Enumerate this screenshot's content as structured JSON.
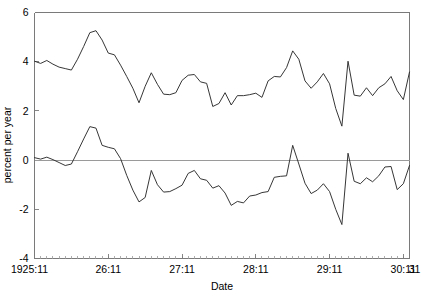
{
  "chart_data": {
    "type": "line",
    "title": "",
    "xlabel": "Date",
    "ylabel": "percent per year",
    "ylim": [
      -4,
      6
    ],
    "yticks": [
      -4,
      -2,
      0,
      2,
      4,
      6
    ],
    "ytick_labels": [
      "-4",
      "-2",
      "0",
      "2",
      "4",
      "6"
    ],
    "xlim": [
      0,
      61
    ],
    "xticks": [
      0,
      12,
      24,
      36,
      48,
      60
    ],
    "xtick_labels": [
      "1925:11",
      "26:11",
      "27:11",
      "28:11",
      "29:11",
      "30:11",
      "31"
    ],
    "xtick_positions": [
      0,
      12,
      24,
      36,
      48,
      60,
      61
    ],
    "grid": false,
    "legend": "none",
    "zero_line": 0,
    "minor_tick_interval": 1,
    "n_points": 62,
    "x": [
      0,
      1,
      2,
      3,
      4,
      5,
      6,
      7,
      8,
      9,
      10,
      11,
      12,
      13,
      14,
      15,
      16,
      17,
      18,
      19,
      20,
      21,
      22,
      23,
      24,
      25,
      26,
      27,
      28,
      29,
      30,
      31,
      32,
      33,
      34,
      35,
      36,
      37,
      38,
      39,
      40,
      41,
      42,
      43,
      44,
      45,
      46,
      47,
      48,
      49,
      50,
      51,
      52,
      53,
      54,
      55,
      56,
      57,
      58,
      59,
      60,
      61
    ],
    "series": [
      {
        "name": "upper",
        "values": [
          4.02,
          3.93,
          4.05,
          3.9,
          3.78,
          3.72,
          3.66,
          4.1,
          4.62,
          5.18,
          5.26,
          4.88,
          4.35,
          4.28,
          3.86,
          3.4,
          2.92,
          2.33,
          3.0,
          3.55,
          3.08,
          2.68,
          2.66,
          2.74,
          3.24,
          3.45,
          3.48,
          3.18,
          3.12,
          2.18,
          2.3,
          2.74,
          2.24,
          2.62,
          2.62,
          2.66,
          2.72,
          2.55,
          3.22,
          3.4,
          3.38,
          3.76,
          4.44,
          4.1,
          3.22,
          2.92,
          3.18,
          3.52,
          3.1,
          2.1,
          1.38,
          4.02,
          2.64,
          2.6,
          2.94,
          2.62,
          2.94,
          3.1,
          3.4,
          2.82,
          2.46,
          3.58
        ]
      },
      {
        "name": "lower",
        "values": [
          0.1,
          0.04,
          0.12,
          0.02,
          -0.1,
          -0.22,
          -0.16,
          0.34,
          0.86,
          1.36,
          1.3,
          0.6,
          0.52,
          0.46,
          0.06,
          -0.62,
          -1.22,
          -1.7,
          -1.52,
          -0.42,
          -1.0,
          -1.3,
          -1.28,
          -1.16,
          -1.02,
          -0.54,
          -0.42,
          -0.76,
          -0.82,
          -1.14,
          -1.04,
          -1.34,
          -1.84,
          -1.68,
          -1.74,
          -1.46,
          -1.42,
          -1.32,
          -1.28,
          -0.7,
          -0.66,
          -0.64,
          0.6,
          -0.16,
          -0.94,
          -1.36,
          -1.22,
          -0.96,
          -1.28,
          -2.0,
          -2.62,
          0.28,
          -0.86,
          -0.96,
          -0.72,
          -0.88,
          -0.64,
          -0.28,
          -0.26,
          -1.2,
          -0.96,
          -0.22
        ]
      }
    ]
  },
  "colors": {
    "series_stroke": "#2b2b2b",
    "axis": "#7a7a7a",
    "zero_line": "#9a9a9a",
    "background": "#ffffff"
  }
}
